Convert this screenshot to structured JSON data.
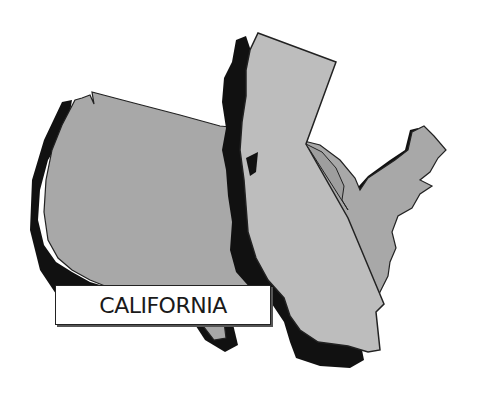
{
  "illustration": {
    "subject": "United States map with California enlarged overlay",
    "label": "CALIFORNIA",
    "colors": {
      "background": "#ffffff",
      "us_fill": "#a9a9a9",
      "california_fill": "#bcbcbc",
      "shadow": "#111111",
      "outline": "#222222",
      "label_bg": "#ffffff"
    }
  }
}
